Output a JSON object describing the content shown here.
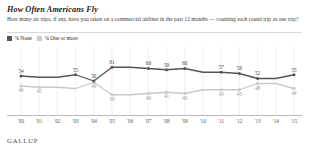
{
  "header": {
    "title": "How Often Americans Fly",
    "subtitle": "How many air trips, if any, have you taken on a commercial airliner in the past 12 months — counting each round trip as one trip?"
  },
  "legend": [
    {
      "label": "% None",
      "color": "#555555",
      "key": "none"
    },
    {
      "label": "% One or more",
      "color": "#c9c9c9",
      "key": "one_or_more"
    }
  ],
  "footer": {
    "brand": "GALLUP"
  },
  "chart_data": {
    "type": "line",
    "title": "How Often Americans Fly",
    "xlabel": "",
    "ylabel": "",
    "ylim": [
      30,
      70
    ],
    "grid": true,
    "legend_position": "top-left",
    "categories": [
      "'00",
      "'01",
      "'02",
      "'03",
      "'04",
      "'05",
      "'06",
      "'07",
      "'08",
      "'09",
      "'10",
      "'11",
      "'12",
      "'13",
      "'14",
      "'15"
    ],
    "series": [
      {
        "name": "% None",
        "color": "#555555",
        "values": [
          54,
          53,
          53,
          55,
          50,
          61,
          61,
          60,
          59,
          60,
          57,
          57,
          56,
          52,
          52,
          55
        ],
        "labels": [
          "54",
          "",
          "",
          "55",
          "50",
          "61",
          "",
          "60",
          "59",
          "60",
          "",
          "57",
          "56",
          "52",
          "",
          "55"
        ]
      },
      {
        "name": "% One or more",
        "color": "#c9c9c9",
        "values": [
          46,
          45,
          45,
          44,
          49,
          39,
          39,
          40,
          41,
          40,
          43,
          43,
          43,
          48,
          48,
          44
        ],
        "labels": [
          "46",
          "45",
          "",
          "",
          "49",
          "39",
          "",
          "40",
          "41",
          "40",
          "",
          "43",
          "43",
          "48",
          "",
          "44"
        ]
      }
    ]
  }
}
